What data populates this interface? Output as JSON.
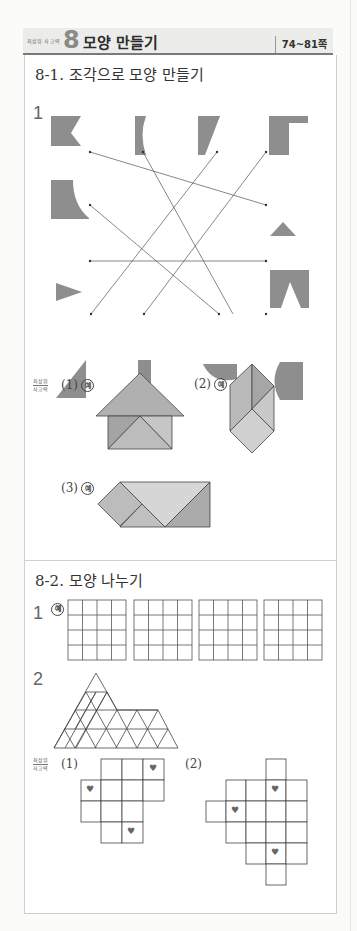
{
  "header": {
    "badge_small": "최상위 사고력",
    "chapter_number": "8",
    "chapter_title": "모양 만들기",
    "pages": "74~81쪽"
  },
  "section1": {
    "title": "8-1. 조각으로 모양 만들기",
    "q1_number": "1",
    "matching": {
      "top_shapes": [
        "notched-square",
        "concave-bar",
        "trapezoid",
        "l-block"
      ],
      "left_shapes": [
        "quarter-cut-square",
        "triangle-right-pointing"
      ],
      "right_shapes": [
        "triangle",
        "notched-rectangle"
      ],
      "bottom_shapes": [
        "right-triangle",
        "rectangle",
        "half-circle",
        "convex-bar"
      ]
    },
    "advanced_label_top": "최상위",
    "advanced_label_bottom": "사고력",
    "sub1_label": "(1)",
    "sub2_label": "(2)",
    "sub3_label": "(3)",
    "example_mark": "예"
  },
  "section2": {
    "title": "8-2. 모양 나누기",
    "q1_number": "1",
    "q2_number": "2",
    "example_mark": "예",
    "grids": {
      "count": 4,
      "rows": 4,
      "cols": 4
    },
    "advanced_label_top": "최상위",
    "advanced_label_bottom": "사고력",
    "sub1_label": "(1)",
    "sub2_label": "(2)",
    "heart_icon": "♥"
  },
  "colors": {
    "shape_gray": "#8e8e8e",
    "tangram_dark": "#a9a9a9",
    "tangram_mid": "#bdbdbd",
    "tangram_light": "#d2d2d2",
    "line": "#555555"
  }
}
